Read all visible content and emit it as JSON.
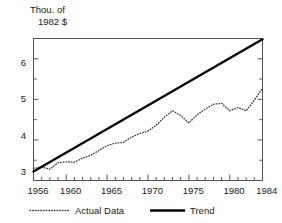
{
  "chart_data": {
    "type": "line",
    "title": "",
    "ylabel": "Thou. of 1982 $",
    "ylabel_line1": "Thou. of",
    "ylabel_line2": "1982 $",
    "xlabel": "",
    "xlim": [
      1956,
      1984
    ],
    "ylim": [
      3,
      6.5
    ],
    "yticks": [
      3,
      4,
      5,
      6
    ],
    "ytick_labels": [
      "3",
      "4",
      "5",
      "6"
    ],
    "yminor_ticks": [
      3.5,
      4.5,
      5.5,
      6.5
    ],
    "xticks": [
      1956,
      1960,
      1965,
      1970,
      1975,
      1980,
      1984
    ],
    "xtick_labels": [
      "1956",
      "1960",
      "1965",
      "1970",
      "1975",
      "1980",
      "1984"
    ],
    "xminor_tick_interval": 1,
    "grid": false,
    "legend_position": "below-axis",
    "frame": true,
    "series": [
      {
        "name": "Actual Data",
        "style": "dotted",
        "color": "#3a3a3a",
        "x": [
          1956,
          1957,
          1958,
          1959,
          1960,
          1961,
          1962,
          1963,
          1964,
          1965,
          1966,
          1967,
          1968,
          1969,
          1970,
          1971,
          1972,
          1973,
          1974,
          1975,
          1976,
          1977,
          1978,
          1979,
          1980,
          1981,
          1982,
          1983,
          1984
        ],
        "values": [
          3.3,
          3.33,
          3.28,
          3.44,
          3.46,
          3.45,
          3.55,
          3.62,
          3.74,
          3.86,
          3.92,
          3.94,
          4.07,
          4.16,
          4.22,
          4.36,
          4.56,
          4.72,
          4.6,
          4.42,
          4.62,
          4.76,
          4.88,
          4.9,
          4.72,
          4.8,
          4.72,
          4.98,
          5.28
        ]
      },
      {
        "name": "Trend",
        "style": "solid",
        "color": "#000000",
        "x": [
          1956,
          1984
        ],
        "values": [
          3.22,
          6.48
        ]
      }
    ],
    "legend": [
      {
        "label": "Actual Data",
        "style": "dotted"
      },
      {
        "label": "Trend",
        "style": "solid"
      }
    ]
  },
  "legend": {
    "actual_label": "Actual Data",
    "trend_label": "Trend"
  },
  "axes": {
    "y_unit_line1": "Thou. of",
    "y_unit_line2": "1982 $",
    "y_label_6": "6",
    "y_label_5": "5",
    "y_label_4": "4",
    "y_label_3": "3",
    "x_label_1956": "1956",
    "x_label_1960": "1960",
    "x_label_1965": "1965",
    "x_label_1970": "1970",
    "x_label_1975": "1975",
    "x_label_1980": "1980",
    "x_label_1984": "1984"
  },
  "colors": {
    "frame": "#555555",
    "trend": "#000000",
    "actual": "#3a3a3a",
    "background": "#ffffff"
  }
}
